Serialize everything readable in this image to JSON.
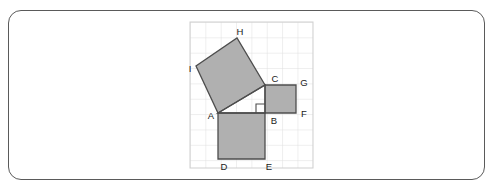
{
  "figure": {
    "colors": {
      "square_fill": "#b0b0b0",
      "square_stroke": "#4d4d4d",
      "grid_line": "#dcdcdc",
      "grid_border": "#c8c8c8",
      "card_border": "#5a5a5a",
      "label_text": "#1a1a1a",
      "background": "#ffffff"
    },
    "grid": {
      "left": 190,
      "top": 22,
      "right": 313,
      "bottom": 168,
      "cell_size": 15.35,
      "columns": 8,
      "rows": 9.5
    },
    "points": {
      "A": {
        "x": 218,
        "y": 113,
        "label": "A",
        "label_x": 211,
        "label_y": 119
      },
      "B": {
        "x": 265,
        "y": 113,
        "label": "B",
        "label_x": 271,
        "label_y": 124
      },
      "C": {
        "x": 265,
        "y": 85,
        "label": "C",
        "label_x": 272,
        "label_y": 82
      },
      "D": {
        "x": 218,
        "y": 159,
        "label": "D",
        "label_x": 222,
        "label_y": 170
      },
      "E": {
        "x": 265,
        "y": 159,
        "label": "E",
        "label_x": 266,
        "label_y": 170
      },
      "F": {
        "x": 296,
        "y": 113,
        "label": "F",
        "label_x": 301,
        "label_y": 117
      },
      "G": {
        "x": 296,
        "y": 85,
        "label": "G",
        "label_x": 301,
        "label_y": 86
      },
      "H": {
        "x": 237,
        "y": 38,
        "label": "H",
        "label_x": 238,
        "label_y": 35
      },
      "I": {
        "x": 196,
        "y": 66,
        "label": "I",
        "label_x": 189,
        "label_y": 72
      }
    },
    "squares": [
      {
        "name": "square-on-leg-AB",
        "vertices": "A,B,E,D",
        "polygon": "218,113 265,113 265,159 218,159"
      },
      {
        "name": "square-on-leg-BC",
        "vertices": "B,C,G,F",
        "polygon": "265,113 265,85 296,85 296,113"
      },
      {
        "name": "square-on-hypotenuse-AC",
        "vertices": "A,C,H,I",
        "polygon": "218,113 265,85 237,38 196,66"
      }
    ],
    "triangle": {
      "name": "right-triangle-ABC",
      "vertices": "A,B,C",
      "polygon": "218,113 265,113 265,85"
    },
    "right_angle_marker": {
      "at_vertex": "B",
      "path": "M 256,113 L 256,104 L 265,104"
    }
  }
}
